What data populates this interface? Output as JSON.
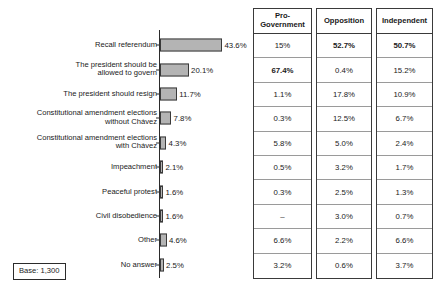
{
  "chart_data": {
    "type": "bar",
    "orientation": "horizontal",
    "title": "",
    "xlabel": "",
    "ylabel": "",
    "xlim": [
      0,
      46
    ],
    "grid": false,
    "legend": false,
    "categories": [
      "Recall referendum",
      "The president should be\nallowed to govern",
      "The president should resign",
      "Constitutional amendment elections\nwithout Chávez",
      "Constitutional amendment elections\nwith Chávez",
      "Impeachment",
      "Peaceful protest",
      "Civil disobedience",
      "Other",
      "No answer"
    ],
    "values": [
      43.6,
      20.1,
      11.7,
      7.8,
      4.3,
      2.1,
      1.6,
      1.6,
      4.6,
      2.5
    ],
    "value_labels": [
      "43.6%",
      "20.1%",
      "11.7%",
      "7.8%",
      "4.3%",
      "2.1%",
      "1.6%",
      "1.6%",
      "4.6%",
      "2.5%"
    ],
    "bar_color": "#b4b4b4",
    "bar_border_color": "#3a3a3a",
    "base_note": "Base: 1,300"
  },
  "table": {
    "columns": [
      "Pro-\nGovernment",
      "Opposition",
      "Independent"
    ],
    "rows": [
      {
        "cells": [
          {
            "text": "15%",
            "bold": false
          },
          {
            "text": "52.7%",
            "bold": true
          },
          {
            "text": "50.7%",
            "bold": true
          }
        ]
      },
      {
        "cells": [
          {
            "text": "67.4%",
            "bold": true
          },
          {
            "text": "0.4%",
            "bold": false
          },
          {
            "text": "15.2%",
            "bold": false
          }
        ]
      },
      {
        "cells": [
          {
            "text": "1.1%",
            "bold": false
          },
          {
            "text": "17.8%",
            "bold": false
          },
          {
            "text": "10.9%",
            "bold": false
          }
        ]
      },
      {
        "cells": [
          {
            "text": "0.3%",
            "bold": false
          },
          {
            "text": "12.5%",
            "bold": false
          },
          {
            "text": "6.7%",
            "bold": false
          }
        ]
      },
      {
        "cells": [
          {
            "text": "5.8%",
            "bold": false
          },
          {
            "text": "5.0%",
            "bold": false
          },
          {
            "text": "2.4%",
            "bold": false
          }
        ]
      },
      {
        "cells": [
          {
            "text": "0.5%",
            "bold": false
          },
          {
            "text": "3.2%",
            "bold": false
          },
          {
            "text": "1.7%",
            "bold": false
          }
        ]
      },
      {
        "cells": [
          {
            "text": "0.3%",
            "bold": false
          },
          {
            "text": "2.5%",
            "bold": false
          },
          {
            "text": "1.3%",
            "bold": false
          }
        ]
      },
      {
        "cells": [
          {
            "text": "–",
            "bold": false
          },
          {
            "text": "3.0%",
            "bold": false
          },
          {
            "text": "0.7%",
            "bold": false
          }
        ]
      },
      {
        "cells": [
          {
            "text": "6.6%",
            "bold": false
          },
          {
            "text": "2.2%",
            "bold": false
          },
          {
            "text": "6.6%",
            "bold": false
          }
        ]
      },
      {
        "cells": [
          {
            "text": "3.2%",
            "bold": false
          },
          {
            "text": "0.6%",
            "bold": false
          },
          {
            "text": "3.7%",
            "bold": false
          }
        ]
      }
    ]
  }
}
